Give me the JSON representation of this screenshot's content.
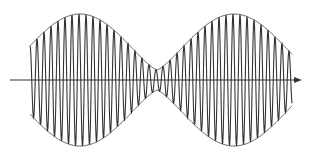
{
  "figure": {
    "width": 314,
    "height": 157,
    "background": "#ffffff",
    "stroke_color": "#333333",
    "envelope_color": "#555555",
    "axis": {
      "y": 80,
      "x_start": 10,
      "x_end": 302,
      "has_arrow": true
    },
    "wave": {
      "x_start": 30,
      "x_end": 292,
      "center_y": 80,
      "carrier_period_px": 7.0,
      "envelope": {
        "max_amplitude": 66,
        "min_amplitude": 10,
        "peak_x": [
          80,
          237
        ],
        "minimum_x": 157
      }
    }
  }
}
